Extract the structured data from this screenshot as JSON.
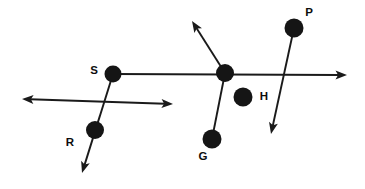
{
  "figure": {
    "canvas": {
      "width": 365,
      "height": 189,
      "background": "#ffffff"
    },
    "stroke_color": "#1a1a1a",
    "dot_color": "#151515",
    "label_color": "#0d0d0d",
    "points": [
      {
        "id": "point-s",
        "label": "S",
        "cx": 113,
        "cy": 74,
        "r": 8.5,
        "label_x": 94,
        "label_y": 71
      },
      {
        "id": "point-r",
        "label": "R",
        "cx": 95,
        "cy": 130,
        "r": 9,
        "label_x": 70,
        "label_y": 143
      },
      {
        "id": "point-junction",
        "label": "",
        "cx": 225,
        "cy": 73,
        "r": 9,
        "label_x": 0,
        "label_y": 0
      },
      {
        "id": "point-h",
        "label": "H",
        "cx": 243,
        "cy": 97,
        "r": 9.5,
        "label_x": 264,
        "label_y": 97
      },
      {
        "id": "point-p",
        "label": "P",
        "cx": 294,
        "cy": 28,
        "r": 9.5,
        "label_x": 309,
        "label_y": 13
      },
      {
        "id": "point-g",
        "label": "G",
        "cx": 212,
        "cy": 139,
        "r": 9.5,
        "label_x": 203,
        "label_y": 157
      }
    ],
    "rays": [
      {
        "id": "ray-horizontal-main",
        "x1": 113,
        "y1": 74,
        "x2": 347,
        "y2": 75,
        "arrow_start": false,
        "arrow_end": true
      },
      {
        "id": "ray-double-arrow-left",
        "x1": 22,
        "y1": 99,
        "x2": 173,
        "y2": 104,
        "arrow_start": true,
        "arrow_end": true
      },
      {
        "id": "ray-s-through-r",
        "x1": 113,
        "y1": 74,
        "x2": 82,
        "y2": 173,
        "arrow_start": false,
        "arrow_end": true
      },
      {
        "id": "ray-junction-upleft",
        "x1": 225,
        "y1": 73,
        "x2": 192,
        "y2": 21,
        "arrow_start": false,
        "arrow_end": true
      },
      {
        "id": "ray-p-through-h",
        "x1": 294,
        "y1": 28,
        "x2": 271,
        "y2": 134,
        "arrow_start": false,
        "arrow_end": true
      },
      {
        "id": "ray-g-to-junction",
        "x1": 212,
        "y1": 139,
        "x2": 225,
        "y2": 73,
        "arrow_start": false,
        "arrow_end": false
      }
    ]
  }
}
